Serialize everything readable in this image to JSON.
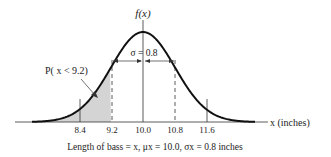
{
  "chart_data": {
    "type": "area",
    "title": "f(x)",
    "xlabel": "x (inches)",
    "ylabel": "f(x)",
    "distribution": "normal",
    "mean": 10.0,
    "sd": 0.8,
    "x_ticks": [
      "8.4",
      "9.2",
      "10.0",
      "10.8",
      "11.6"
    ],
    "x_tick_values": [
      8.4,
      9.2,
      10.0,
      10.8,
      11.6
    ],
    "shaded_region": {
      "from": "-inf",
      "to": 9.2,
      "label": "P( x < 9.2)"
    },
    "dashed_lines": [
      9.2,
      10.8
    ],
    "solid_lines": [
      8.4,
      10.0,
      11.6
    ],
    "sigma_annotation": "σ = 0.8",
    "caption": "Length of bass = x, μx = 10.0, σx = 0.8 inches",
    "grid": false
  },
  "labels": {
    "y_axis": "f(x)",
    "x_axis": "x (inches)",
    "sigma": "σ = 0.8",
    "prob": "P( x < 9.2)",
    "caption": "Length of bass = x, μx = 10.0, σx = 0.8 inches",
    "ticks": [
      "8.4",
      "9.2",
      "10.0",
      "10.8",
      "11.6"
    ]
  }
}
